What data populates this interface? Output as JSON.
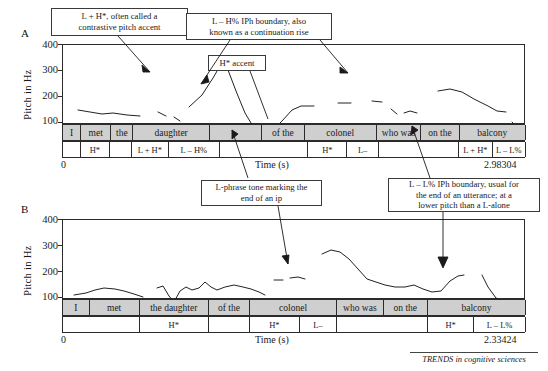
{
  "figure": {
    "footer_source": "TRENDS in cognitive sciences"
  },
  "panels": [
    {
      "letter": "A",
      "ylabel": "Pitch in Hz",
      "yticks": [
        "400",
        "300",
        "200",
        "100"
      ],
      "xlabel": "Time (s)",
      "xmin_label": "0",
      "xmax_label": "2.98304",
      "word_tier": [
        {
          "label": "I",
          "w": 18
        },
        {
          "label": "met",
          "w": 30
        },
        {
          "label": "the",
          "w": 22
        },
        {
          "label": "daughter",
          "w": 76
        },
        {
          "label": "",
          "w": 52
        },
        {
          "label": "of the",
          "w": 42
        },
        {
          "label": "colonel",
          "w": 72
        },
        {
          "label": "who was",
          "w": 44
        },
        {
          "label": "on the",
          "w": 38
        },
        {
          "label": "balcony",
          "w": 66
        }
      ],
      "tone_tier": [
        {
          "label": "",
          "w": 18
        },
        {
          "label": "H*",
          "w": 30
        },
        {
          "label": "",
          "w": 22
        },
        {
          "label": "L + H*",
          "w": 38
        },
        {
          "label": "L – H%",
          "w": 52
        },
        {
          "label": "",
          "w": 90
        },
        {
          "label": "H*",
          "w": 40
        },
        {
          "label": "L–",
          "w": 32
        },
        {
          "label": "",
          "w": 82
        },
        {
          "label": "L + H*",
          "w": 34
        },
        {
          "label": "L – L%",
          "w": 34
        }
      ]
    },
    {
      "letter": "B",
      "ylabel": "Pitch in Hz",
      "yticks": [
        "400",
        "300",
        "200",
        "100"
      ],
      "xlabel": "Time (s)",
      "xmin_label": "0",
      "xmax_label": "2.33424",
      "word_tier": [
        {
          "label": "I",
          "w": 30
        },
        {
          "label": "met",
          "w": 56
        },
        {
          "label": "the daughter",
          "w": 78
        },
        {
          "label": "of the",
          "w": 46
        },
        {
          "label": "colonel",
          "w": 98
        },
        {
          "label": "who was",
          "w": 52
        },
        {
          "label": "on the",
          "w": 50
        },
        {
          "label": "balcony",
          "w": 110
        }
      ],
      "tone_tier": [
        {
          "label": "",
          "w": 86
        },
        {
          "label": "H*",
          "w": 78
        },
        {
          "label": "",
          "w": 46
        },
        {
          "label": "H*",
          "w": 56
        },
        {
          "label": "L–",
          "w": 42
        },
        {
          "label": "",
          "w": 102
        },
        {
          "label": "H*",
          "w": 52
        },
        {
          "label": "L – L%",
          "w": 58
        }
      ]
    }
  ],
  "callouts": [
    {
      "id": "callout-lh-contrastive",
      "line1": "L + H*, often called a",
      "line2": "contrastive pitch accent"
    },
    {
      "id": "callout-lh-iph-boundary",
      "line1": "L – H% IPh boundary, also",
      "line2": "known as a continuation rise"
    },
    {
      "id": "callout-h-accent",
      "line1": "H* accent",
      "line2": ""
    },
    {
      "id": "callout-l-phrase-tone",
      "line1": "L-phrase tone marking the",
      "line2": "end of an ip"
    },
    {
      "id": "callout-ll-iph-boundary",
      "line1": "L – L% IPh boundary, usual for",
      "line2": "the end of an utterance; at a",
      "line3": "lower  pitch than a L-alone"
    }
  ],
  "chart_data": {
    "type": "line",
    "title": "",
    "ylabel": "Pitch in Hz",
    "xlabel": "Time (s)",
    "ylim": [
      100,
      400
    ],
    "yticks": [
      100,
      200,
      300,
      400
    ],
    "grid": false,
    "legend": "none",
    "panels": [
      {
        "name": "A",
        "xlim": [
          0,
          2.98304
        ],
        "utterance": "I met the daughter of the colonel who was on the balcony",
        "tones": [
          "H*",
          "L + H*",
          "L – H%",
          "H*",
          "L–",
          "L + H*",
          "L – L%"
        ],
        "segments": [
          {
            "points": [
              [
                0.1,
                222
              ],
              [
                0.18,
                219
              ],
              [
                0.26,
                214
              ],
              [
                0.33,
                216
              ],
              [
                0.42,
                212
              ],
              [
                0.5,
                210
              ]
            ]
          },
          {
            "points": [
              [
                0.62,
                215
              ],
              [
                0.67,
                208
              ]
            ]
          },
          {
            "points": [
              [
                0.72,
                206
              ],
              [
                0.76,
                200
              ]
            ]
          },
          {
            "points": [
              [
                0.82,
                225
              ],
              [
                0.9,
                245
              ],
              [
                0.97,
                275
              ],
              [
                1.02,
                297
              ],
              [
                1.07,
                290
              ],
              [
                1.12,
                255
              ],
              [
                1.18,
                215
              ],
              [
                1.24,
                190
              ],
              [
                1.3,
                182
              ],
              [
                1.36,
                185
              ],
              [
                1.42,
                200
              ],
              [
                1.48,
                218
              ],
              [
                1.54,
                224
              ],
              [
                1.62,
                224
              ]
            ]
          },
          {
            "points": [
              [
                1.78,
                228
              ],
              [
                1.86,
                228
              ]
            ]
          },
          {
            "points": [
              [
                2.0,
                232
              ],
              [
                2.06,
                230
              ]
            ]
          },
          {
            "points": [
              [
                2.12,
                218
              ],
              [
                2.16,
                210
              ]
            ]
          },
          {
            "points": [
              [
                2.2,
                212
              ],
              [
                2.24,
                214
              ],
              [
                2.28,
                212
              ]
            ]
          },
          {
            "points": [
              [
                2.42,
                245
              ],
              [
                2.5,
                248
              ],
              [
                2.58,
                242
              ],
              [
                2.66,
                232
              ],
              [
                2.74,
                222
              ],
              [
                2.8,
                214
              ],
              [
                2.86,
                212
              ]
            ]
          },
          {
            "points": [
              [
                2.9,
                196
              ],
              [
                2.94,
                186
              ],
              [
                2.98,
                185
              ]
            ]
          }
        ]
      },
      {
        "name": "B",
        "xlim": [
          0,
          2.33424
        ],
        "utterance": "I met the daughter of the colonel who was on the balcony",
        "tones": [
          "H*",
          "H*",
          "L–",
          "H*",
          "L – L%"
        ],
        "segments": [
          {
            "points": [
              [
                0.08,
                185
              ],
              [
                0.16,
                188
              ],
              [
                0.24,
                192
              ],
              [
                0.32,
                195
              ],
              [
                0.4,
                193
              ],
              [
                0.48,
                190
              ],
              [
                0.56,
                186
              ],
              [
                0.62,
                180
              ]
            ]
          },
          {
            "points": [
              [
                0.72,
                196
              ],
              [
                0.76,
                198
              ],
              [
                0.8,
                186
              ],
              [
                0.84,
                178
              ],
              [
                0.88,
                190
              ],
              [
                0.92,
                196
              ],
              [
                0.96,
                192
              ],
              [
                1.0,
                195
              ],
              [
                1.04,
                202
              ],
              [
                1.08,
                196
              ],
              [
                1.12,
                192
              ],
              [
                1.18,
                196
              ],
              [
                1.24,
                198
              ],
              [
                1.3,
                196
              ],
              [
                1.36,
                194
              ],
              [
                1.42,
                190
              ],
              [
                1.46,
                186
              ]
            ]
          },
          {
            "points": [
              [
                1.52,
                206
              ],
              [
                1.58,
                206
              ]
            ]
          },
          {
            "points": [
              [
                1.62,
                208
              ],
              [
                1.68,
                209
              ],
              [
                1.72,
                207
              ]
            ]
          },
          {
            "points": [
              [
                1.86,
                236
              ],
              [
                1.92,
                240
              ],
              [
                1.98,
                238
              ],
              [
                2.04,
                230
              ],
              [
                2.1,
                218
              ],
              [
                2.16,
                206
              ],
              [
                2.22,
                202
              ],
              [
                2.28,
                198
              ],
              [
                2.34,
                196
              ],
              [
                2.4,
                196
              ],
              [
                2.46,
                198
              ],
              [
                2.52,
                194
              ],
              [
                2.58,
                190
              ],
              [
                2.64,
                192
              ],
              [
                2.7,
                204
              ],
              [
                2.76,
                210
              ],
              [
                2.82,
                212
              ]
            ]
          },
          {
            "points": [
              [
                2.96,
                212
              ],
              [
                3.0,
                198
              ],
              [
                3.06,
                184
              ],
              [
                3.12,
                178
              ],
              [
                3.2,
                176
              ],
              [
                3.3,
                175
              ],
              [
                3.4,
                174
              ],
              [
                3.5,
                172
              ]
            ]
          }
        ]
      }
    ]
  }
}
